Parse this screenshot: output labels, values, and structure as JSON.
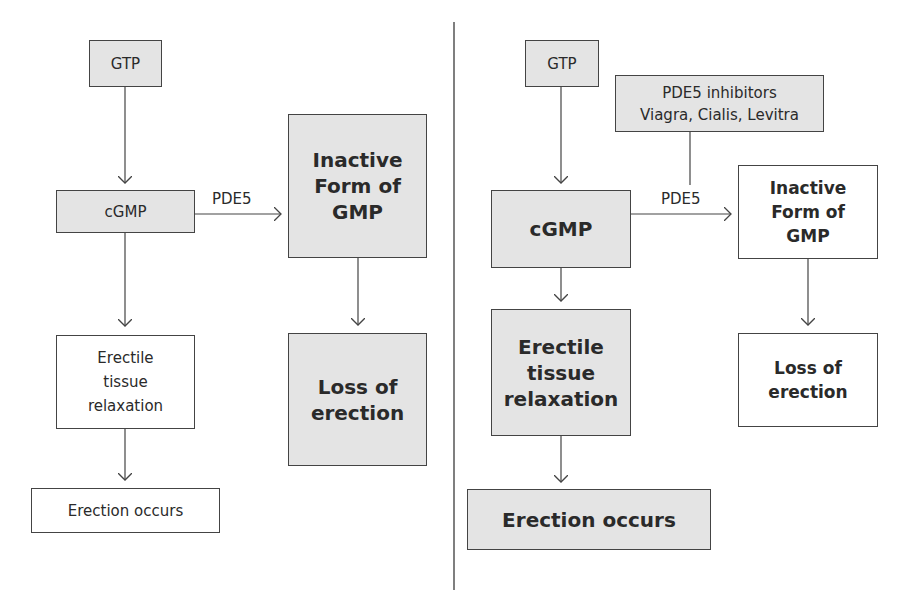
{
  "left_panel": {
    "gtp": "GTP",
    "cgmp": "cGMP",
    "pde5_label": "PDE5",
    "inactive": "Inactive\nForm of\nGMP",
    "relaxation": "Erectile\ntissue\nrelaxation",
    "loss": "Loss of\nerection",
    "erection": "Erection occurs"
  },
  "right_panel": {
    "gtp": "GTP",
    "inhibitors": "PDE5 inhibitors\nViagra, Cialis, Levitra",
    "cgmp": "cGMP",
    "pde5_label": "PDE5",
    "inactive": "Inactive\nForm of\nGMP",
    "relaxation": "Erectile\ntissue\nrelaxation",
    "loss": "Loss of\nerection",
    "erection": "Erection occurs"
  },
  "colors": {
    "box_fill": "#e4e4e4",
    "border": "#444444",
    "divider": "#555555"
  }
}
